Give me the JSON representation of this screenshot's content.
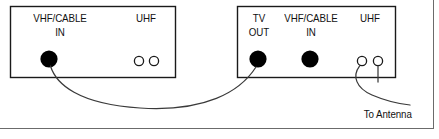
{
  "diagram": {
    "type": "cable-connection-diagram",
    "devices": [
      {
        "id": "device-left",
        "name": "left-device",
        "box": {
          "x": 10,
          "y": 6,
          "w": 166,
          "h": 72
        },
        "ports": [
          {
            "name": "vhf-cable-in",
            "label_line1": "VHF/CABLE",
            "label_line2": "IN",
            "terminal": "filled",
            "cx": 49,
            "cy": 59,
            "r": 8.5
          },
          {
            "name": "uhf",
            "label_line1": "UHF",
            "label_line2": "",
            "terminal": "screw-pair",
            "cx1": 139,
            "cx2": 154,
            "cy": 61,
            "r": 4.5
          }
        ]
      },
      {
        "id": "device-right",
        "name": "right-device",
        "box": {
          "x": 237,
          "y": 6,
          "w": 159,
          "h": 72
        },
        "ports": [
          {
            "name": "tv-out",
            "label_line1": "TV",
            "label_line2": "OUT",
            "terminal": "filled",
            "cx": 258,
            "cy": 59,
            "r": 8.5
          },
          {
            "name": "vhf-cable-in",
            "label_line1": "VHF/CABLE",
            "label_line2": "IN",
            "terminal": "filled",
            "cx": 310,
            "cy": 59,
            "r": 8.5
          },
          {
            "name": "uhf",
            "label_line1": "UHF",
            "label_line2": "",
            "terminal": "screw-pair",
            "cx1": 362,
            "cx2": 378,
            "cy": 61,
            "r": 4.5
          }
        ]
      }
    ],
    "cables": [
      {
        "name": "coax-cable-left-to-right",
        "from": "left-device.vhf-cable-in",
        "to": "right-device.tv-out"
      },
      {
        "name": "antenna-lead-upper",
        "from": "right-device.uhf.terminal-1",
        "to": "antenna"
      },
      {
        "name": "antenna-lead-lower",
        "from": "right-device.uhf.terminal-2",
        "to": "antenna"
      }
    ],
    "annotations": [
      {
        "name": "to-antenna-label",
        "text": "To Antenna",
        "x": 362,
        "y": 108
      }
    ],
    "labels": {
      "left_vhf_cable": "VHF/CABLE",
      "left_in": "IN",
      "left_uhf": "UHF",
      "right_tv": "TV",
      "right_out": "OUT",
      "right_vhf_cable": "VHF/CABLE",
      "right_in": "IN",
      "right_uhf": "UHF",
      "to_antenna": "To Antenna"
    },
    "colors": {
      "stroke": "#1a1a1a",
      "terminal_fill": "#000000",
      "background": "#ffffff",
      "frame_line": "#555555",
      "cable_line": "#3a3a3a"
    }
  }
}
